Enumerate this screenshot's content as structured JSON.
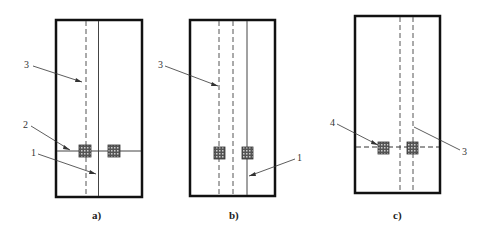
{
  "panels": [
    {
      "caption": "a)",
      "labels": {
        "l3": "3",
        "l2": "2",
        "l1": "1"
      }
    },
    {
      "caption": "b)",
      "labels": {
        "l3": "3",
        "l1": "1"
      }
    },
    {
      "caption": "c)",
      "labels": {
        "l4": "4",
        "l3": "3"
      }
    }
  ]
}
